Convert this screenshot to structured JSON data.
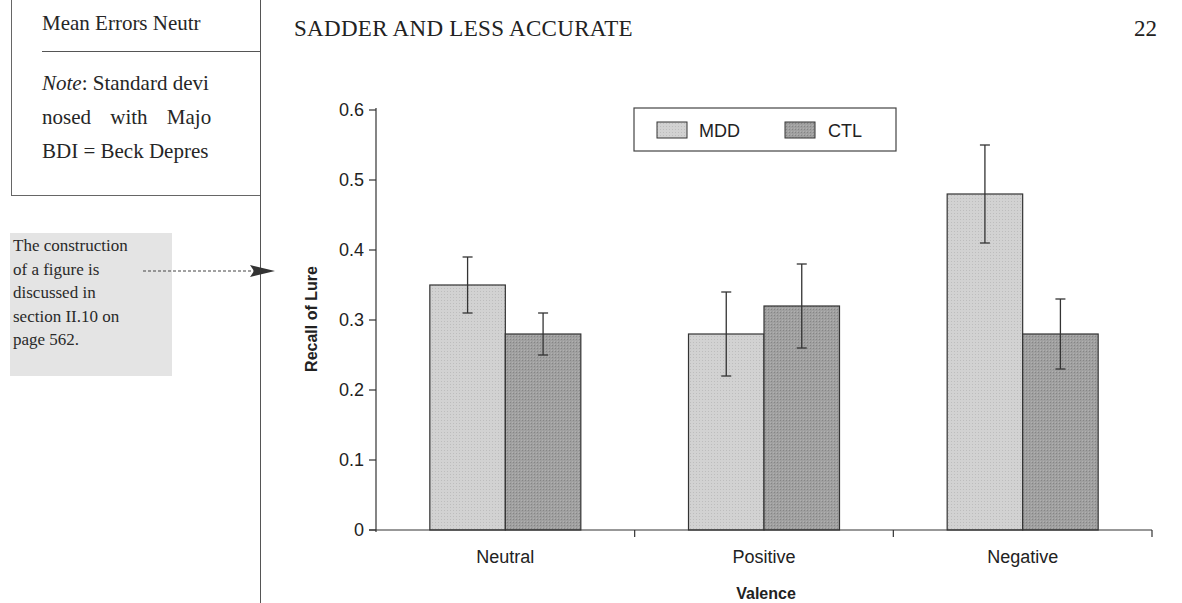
{
  "previous_page": {
    "table_last_row": "Mean Errors Neutr",
    "note_line1_label": "Note",
    "note_line1_text": ": Standard devi",
    "note_line2": "nosed with Majo",
    "note_line3": "BDI = Beck Depres"
  },
  "margin_note": {
    "lines": [
      "The construction",
      "of a figure is",
      "discussed in",
      "section II.10 on",
      "page 562."
    ]
  },
  "header": {
    "running_title": "SADDER AND LESS ACCURATE",
    "page_number": "22"
  },
  "colors": {
    "mdd_fill": "#cfcfcf",
    "ctl_fill": "#9c9c9c",
    "margin_note_bg": "#e4e4e4"
  },
  "chart_data": {
    "type": "bar",
    "title": "",
    "xlabel": "Valence",
    "ylabel": "Recall of Lure",
    "categories": [
      "Neutral",
      "Positive",
      "Negative"
    ],
    "series": [
      {
        "name": "MDD",
        "values": [
          0.35,
          0.28,
          0.48
        ],
        "error_low": [
          0.31,
          0.22,
          0.41
        ],
        "error_high": [
          0.39,
          0.34,
          0.55
        ]
      },
      {
        "name": "CTL",
        "values": [
          0.28,
          0.32,
          0.28
        ],
        "error_low": [
          0.25,
          0.26,
          0.23
        ],
        "error_high": [
          0.31,
          0.38,
          0.33
        ]
      }
    ],
    "ylim": [
      0,
      0.6
    ],
    "yticks": [
      "0",
      "0.1",
      "0.2",
      "0.3",
      "0.4",
      "0.5",
      "0.6"
    ],
    "grid": false,
    "legend_position": "top-center"
  }
}
